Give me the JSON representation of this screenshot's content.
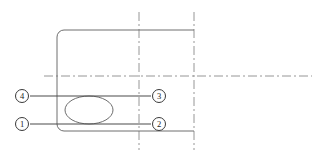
{
  "drawing": {
    "canvas": {
      "width": 324,
      "height": 160,
      "background": "#ffffff"
    },
    "colors": {
      "outline": "#6e6e6e",
      "centerline": "#8a8a8a",
      "leader": "#4a4a4a",
      "callout_stroke": "#3a3a3a",
      "callout_fill": "#ffffff",
      "text": "#1a1a1a"
    },
    "body_outline": {
      "name": "rounded-rectangle-body",
      "x": 57,
      "y": 30,
      "width": 137,
      "height": 101,
      "corner_radius": 7,
      "stroke_width": 1
    },
    "ellipse_feature": {
      "name": "center-ellipse",
      "cx": 89,
      "cy": 110,
      "rx": 24,
      "ry": 14,
      "stroke_width": 1
    },
    "centerlines": {
      "horizontal": {
        "x1": 44,
        "y1": 76,
        "x2": 312,
        "y2": 76
      },
      "vertical_left": {
        "x1": 139,
        "y1": 12,
        "x2": 139,
        "y2": 150
      },
      "vertical_right": {
        "x1": 194,
        "y1": 12,
        "x2": 194,
        "y2": 150
      },
      "dash_pattern": "9 3 2 3"
    },
    "leaders": [
      {
        "name": "leader-line-upper",
        "x1": 30,
        "y1": 96,
        "x2": 151,
        "y2": 96
      },
      {
        "name": "leader-line-lower",
        "x1": 30,
        "y1": 124,
        "x2": 151,
        "y2": 124
      }
    ],
    "callouts": [
      {
        "id": "callout-4",
        "label": "4",
        "cx": 22,
        "cy": 96,
        "r": 6.5,
        "position": "left-upper"
      },
      {
        "id": "callout-1",
        "label": "1",
        "cx": 22,
        "cy": 124,
        "r": 6.5,
        "position": "left-lower"
      },
      {
        "id": "callout-3",
        "label": "3",
        "cx": 159,
        "cy": 96,
        "r": 6.5,
        "position": "right-upper"
      },
      {
        "id": "callout-2",
        "label": "2",
        "cx": 159,
        "cy": 124,
        "r": 6.5,
        "position": "right-lower"
      }
    ]
  }
}
